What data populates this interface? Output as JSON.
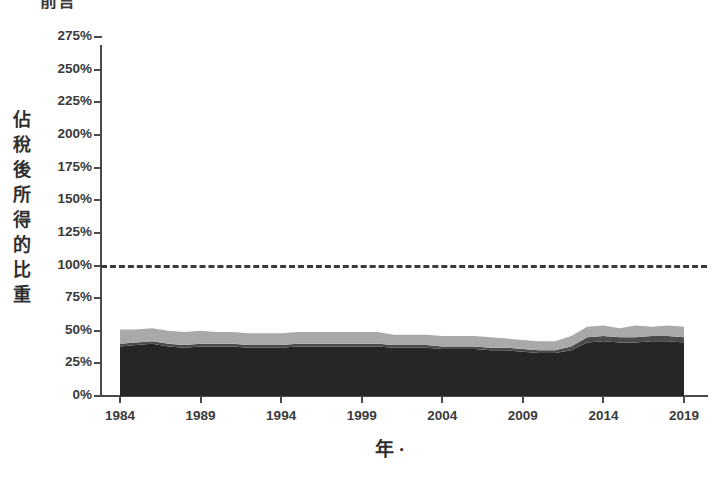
{
  "clipped_title": "前言",
  "axes": {
    "ylabel": "佔稅後所得的比重",
    "ylabel_chars": [
      "佔",
      "稅",
      "後",
      "所",
      "得",
      "的",
      "比",
      "重"
    ],
    "xlabel": "年 ·"
  },
  "chart_data": {
    "type": "area",
    "stacked": true,
    "title": "",
    "xlabel": "年 ·",
    "ylabel": "佔稅後所得的比重",
    "xlim": [
      1984,
      2019
    ],
    "ylim": [
      0,
      275
    ],
    "ytick_labels": [
      "0%",
      "25%",
      "50%",
      "75%",
      "100%",
      "125%",
      "150%",
      "175%",
      "200%",
      "225%",
      "250%",
      "275%"
    ],
    "ytick_values": [
      0,
      25,
      50,
      75,
      100,
      125,
      150,
      175,
      200,
      225,
      250,
      275
    ],
    "xtick_labels": [
      "1984",
      "1989",
      "1994",
      "1999",
      "2004",
      "2009",
      "2014",
      "2019"
    ],
    "xtick_values": [
      1984,
      1989,
      1994,
      1999,
      2004,
      2009,
      2014,
      2019
    ],
    "grid": false,
    "legend": "none",
    "reference_line": {
      "value": 100,
      "label": "100%",
      "style": "dashed",
      "color": "#3b3b3b"
    },
    "x": [
      1984,
      1985,
      1986,
      1987,
      1988,
      1989,
      1990,
      1991,
      1992,
      1993,
      1994,
      1995,
      1996,
      1997,
      1998,
      1999,
      2000,
      2001,
      2002,
      2003,
      2004,
      2005,
      2006,
      2007,
      2008,
      2009,
      2010,
      2011,
      2012,
      2013,
      2014,
      2015,
      2016,
      2017,
      2018,
      2019
    ],
    "series": [
      {
        "name": "series-1",
        "color": "#262626",
        "values": [
          38,
          39,
          40,
          38,
          37,
          38,
          38,
          38,
          37,
          37,
          37,
          38,
          38,
          38,
          38,
          38,
          38,
          37,
          37,
          37,
          36,
          36,
          36,
          35,
          35,
          34,
          33,
          33,
          35,
          41,
          42,
          41,
          41,
          42,
          42,
          41
        ]
      },
      {
        "name": "series-2",
        "color": "#4b4b4b",
        "values": [
          2,
          2,
          2,
          2,
          2,
          2,
          2,
          2,
          2,
          2,
          2,
          2,
          2,
          2,
          2,
          2,
          2,
          2,
          2,
          2,
          2,
          2,
          2,
          2,
          2,
          2,
          2,
          2,
          3,
          4,
          4,
          4,
          4,
          4,
          4,
          4
        ]
      },
      {
        "name": "series-3",
        "color": "#a9a9a9",
        "values": [
          11,
          10,
          10,
          10,
          10,
          10,
          9,
          9,
          9,
          9,
          9,
          9,
          9,
          9,
          9,
          9,
          9,
          8,
          8,
          8,
          8,
          8,
          8,
          8,
          7,
          7,
          7,
          7,
          8,
          8,
          8,
          7,
          9,
          7,
          8,
          8
        ]
      }
    ],
    "stack_totals": [
      51,
      51,
      52,
      50,
      49,
      50,
      49,
      49,
      48,
      48,
      48,
      49,
      49,
      49,
      49,
      49,
      49,
      47,
      47,
      47,
      46,
      46,
      46,
      45,
      44,
      43,
      42,
      42,
      46,
      53,
      54,
      52,
      54,
      53,
      54,
      53
    ]
  }
}
